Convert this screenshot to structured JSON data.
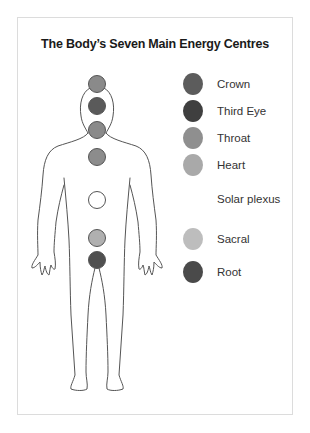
{
  "diagram": {
    "title": "The Body’s Seven Main Energy Centres",
    "chakras": [
      {
        "name": "Crown",
        "color": "#5c5c5c",
        "body_color": "#8a8a8a",
        "body_y": 84
      },
      {
        "name": "Third Eye",
        "color": "#3f3f3f",
        "body_color": "#5a5a5a",
        "body_y": 106
      },
      {
        "name": "Throat",
        "color": "#8f8f8f",
        "body_color": "#8a8a8a",
        "body_y": 130
      },
      {
        "name": "Heart",
        "color": "#a9a9a9",
        "body_color": "#8c8c8c",
        "body_y": 157
      },
      {
        "name": "Solar plexus",
        "color": "#ffffff",
        "body_color": "#ffffff",
        "body_y": 200
      },
      {
        "name": "Sacral",
        "color": "#bdbdbd",
        "body_color": "#b0b0b0",
        "body_y": 238
      },
      {
        "name": "Root",
        "color": "#4a4a4a",
        "body_color": "#505050",
        "body_y": 260
      }
    ]
  }
}
